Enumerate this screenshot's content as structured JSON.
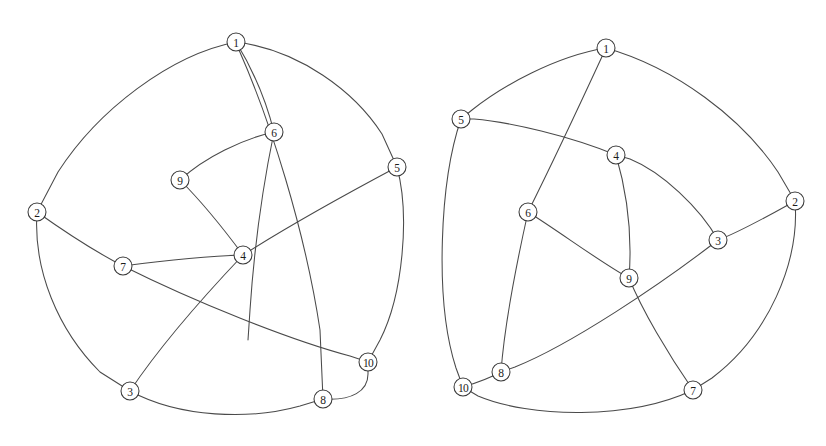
{
  "figure": {
    "background_color": "#ffffff",
    "stroke_color": "#4a4a4a",
    "node_fill_color": "#ffffff",
    "node_stroke_color": "#3a3a3a",
    "label_color": "#1c1c1c",
    "node_radius": 9,
    "width": 826,
    "height": 446
  },
  "graphs": [
    {
      "id": "left-graph",
      "name": "left-graph",
      "nodes": [
        {
          "label": "1",
          "x": 236,
          "y": 42
        },
        {
          "label": "2",
          "x": 37,
          "y": 212
        },
        {
          "label": "3",
          "x": 130,
          "y": 391
        },
        {
          "label": "4",
          "x": 243,
          "y": 255
        },
        {
          "label": "5",
          "x": 397,
          "y": 167
        },
        {
          "label": "6",
          "x": 274,
          "y": 132
        },
        {
          "label": "7",
          "x": 123,
          "y": 266
        },
        {
          "label": "8",
          "x": 323,
          "y": 399
        },
        {
          "label": "9",
          "x": 180,
          "y": 180
        },
        {
          "label": "10",
          "x": 368,
          "y": 362
        }
      ],
      "edges": [
        {
          "from": "1",
          "to": "2",
          "path": "M 236 42 C 170 55 98 110 58 172 L 37 212"
        },
        {
          "from": "1",
          "to": "5",
          "path": "M 236 42 C 300 50 355 92 382 134 L 397 167"
        },
        {
          "from": "1",
          "to": "6",
          "path": "M 236 42 C 252 68 266 100 274 132"
        },
        {
          "from": "1",
          "to": "8",
          "path": "M 239 50 C 270 120 305 230 320 330 L 323 399"
        },
        {
          "from": "2",
          "to": "3",
          "path": "M 37 212 C 33 270 58 330 100 372 L 130 391"
        },
        {
          "from": "2",
          "to": "7",
          "path": "M 37 212 C 65 232 96 252 123 266"
        },
        {
          "from": "3",
          "to": "4",
          "path": "M 130 391 C 162 343 206 294 243 255"
        },
        {
          "from": "3",
          "to": "8",
          "path": "M 130 391 C 180 418 250 420 300 406 L 323 399"
        },
        {
          "from": "4",
          "to": "5",
          "path": "M 243 255 C 290 225 350 192 397 167"
        },
        {
          "from": "4",
          "to": "7",
          "path": "M 243 255 C 205 256 160 261 123 266"
        },
        {
          "from": "4",
          "to": "9",
          "path": "M 243 255 C 226 232 200 200 180 180"
        },
        {
          "from": "5",
          "to": "10",
          "path": "M 397 167 C 410 215 403 295 380 340 L 368 362"
        },
        {
          "from": "6",
          "to": "9",
          "path": "M 274 132 C 243 139 205 157 180 180"
        },
        {
          "from": "6",
          "to": "8",
          "path": "M 274 132 C 262 190 254 250 250 310 L 248 340"
        },
        {
          "from": "7",
          "to": "10",
          "path": "M 123 266 C 195 302 290 340 350 356 L 368 362"
        },
        {
          "from": "8",
          "to": "10",
          "path": "M 323 399 C 352 401 368 391 368 374 L 368 362"
        }
      ]
    },
    {
      "id": "right-graph",
      "name": "right-graph",
      "nodes": [
        {
          "label": "1",
          "x": 606,
          "y": 48
        },
        {
          "label": "2",
          "x": 795,
          "y": 201
        },
        {
          "label": "3",
          "x": 718,
          "y": 240
        },
        {
          "label": "4",
          "x": 616,
          "y": 155
        },
        {
          "label": "5",
          "x": 461,
          "y": 119
        },
        {
          "label": "6",
          "x": 528,
          "y": 212
        },
        {
          "label": "7",
          "x": 693,
          "y": 390
        },
        {
          "label": "8",
          "x": 501,
          "y": 372
        },
        {
          "label": "9",
          "x": 629,
          "y": 278
        },
        {
          "label": "10",
          "x": 463,
          "y": 387
        }
      ],
      "edges": [
        {
          "from": "1",
          "to": "5",
          "path": "M 606 48 C 556 56 502 86 472 110 L 461 119"
        },
        {
          "from": "1",
          "to": "2",
          "path": "M 606 48 C 676 68 742 118 778 172 L 795 201"
        },
        {
          "from": "1",
          "to": "6",
          "path": "M 606 48 C 582 100 551 166 528 212"
        },
        {
          "from": "2",
          "to": "3",
          "path": "M 795 201 C 768 216 740 232 718 240"
        },
        {
          "from": "2",
          "to": "7",
          "path": "M 795 201 C 800 262 768 336 712 378 L 693 390"
        },
        {
          "from": "3",
          "to": "4",
          "path": "M 718 240 C 700 208 662 172 630 159 L 616 155"
        },
        {
          "from": "3",
          "to": "8",
          "path": "M 718 240 C 660 285 570 345 515 367 L 501 372"
        },
        {
          "from": "4",
          "to": "5",
          "path": "M 616 155 C 570 136 510 122 474 119 L 461 119"
        },
        {
          "from": "4",
          "to": "9",
          "path": "M 616 155 C 628 196 632 240 629 278"
        },
        {
          "from": "5",
          "to": "10",
          "path": "M 461 119 C 440 180 434 300 456 368 L 463 387"
        },
        {
          "from": "6",
          "to": "8",
          "path": "M 528 212 C 516 266 504 330 501 372"
        },
        {
          "from": "6",
          "to": "9",
          "path": "M 528 212 C 560 232 600 262 629 278"
        },
        {
          "from": "7",
          "to": "9",
          "path": "M 693 390 C 668 354 642 310 629 278"
        },
        {
          "from": "7",
          "to": "10",
          "path": "M 693 390 C 630 420 530 418 478 396 L 463 387"
        },
        {
          "from": "8",
          "to": "10",
          "path": "M 501 372 C 490 378 476 383 463 387"
        }
      ]
    }
  ]
}
